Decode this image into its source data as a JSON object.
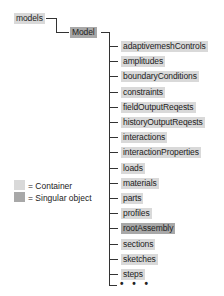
{
  "root": {
    "label": "models",
    "type": "container"
  },
  "child": {
    "label": "Model",
    "type": "singular"
  },
  "items": [
    {
      "label": "adaptivemeshControls",
      "type": "container"
    },
    {
      "label": "amplitudes",
      "type": "container"
    },
    {
      "label": "boundaryConditions",
      "type": "container"
    },
    {
      "label": "constraints",
      "type": "container"
    },
    {
      "label": "fieldOutputReqests",
      "type": "container"
    },
    {
      "label": "historyOutputReqests",
      "type": "container"
    },
    {
      "label": "interactions",
      "type": "container"
    },
    {
      "label": "interactionProperties",
      "type": "container"
    },
    {
      "label": "loads",
      "type": "container"
    },
    {
      "label": "materials",
      "type": "container"
    },
    {
      "label": "parts",
      "type": "container"
    },
    {
      "label": "profiles",
      "type": "container"
    },
    {
      "label": "rootAssembly",
      "type": "singular"
    },
    {
      "label": "sections",
      "type": "container"
    },
    {
      "label": "sketches",
      "type": "container"
    },
    {
      "label": "steps",
      "type": "container"
    }
  ],
  "more": "• • •",
  "legend": {
    "container": "= Container",
    "singular": "= Singular object"
  },
  "colors": {
    "container": "#d9d9d9",
    "singular": "#a8a8a8",
    "line": "#333333"
  }
}
